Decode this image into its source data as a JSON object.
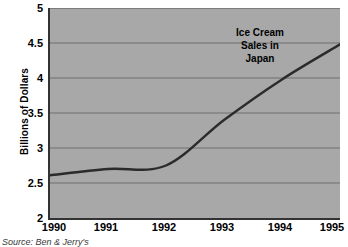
{
  "chart_data": {
    "type": "line",
    "title": "",
    "xlabel": "",
    "ylabel": "Billions of Dollars",
    "annotation": [
      "Ice Cream",
      "Sales in",
      "Japan"
    ],
    "annotation_text": "Ice Cream Sales in Japan",
    "source_note": "Source: Ben & Jerry's",
    "categories": [
      "1990",
      "1991",
      "1992",
      "1993",
      "1994",
      "1995"
    ],
    "x": [
      1990,
      1991,
      1992,
      1993,
      1994,
      1995
    ],
    "values": [
      2.61,
      2.7,
      2.75,
      3.4,
      3.98,
      4.48
    ],
    "series": [
      {
        "name": "Ice Cream Sales in Japan",
        "values": [
          2.61,
          2.7,
          2.75,
          3.4,
          3.98,
          4.48
        ]
      }
    ],
    "xlim": [
      1990,
      1995
    ],
    "ylim": [
      2,
      5
    ],
    "yticks": [
      "2",
      "2.5",
      "3",
      "3.5",
      "4",
      "4.5",
      "5"
    ],
    "ytick_values": [
      2,
      2.5,
      3,
      3.5,
      4,
      4.5,
      5
    ],
    "xticks": [
      "1990",
      "1991",
      "1992",
      "1993",
      "1994",
      "1995"
    ],
    "grid": "horizontal",
    "legend": "none",
    "colors": {
      "plot_background": "#a8a8a8",
      "gridline": "#6e6e6e",
      "axis": "#333333",
      "line": "#2b2b2b",
      "text": "#000000",
      "page_background": "#ffffff"
    }
  }
}
